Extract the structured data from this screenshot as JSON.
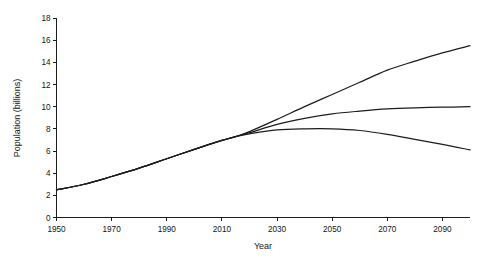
{
  "chart_data": {
    "type": "line",
    "title": "",
    "xlabel": "Year",
    "ylabel": "Population (billions)",
    "xlim": [
      1950,
      2100
    ],
    "ylim": [
      0,
      18
    ],
    "xticks": [
      1950,
      1970,
      1990,
      2010,
      2030,
      2050,
      2070,
      2090
    ],
    "yticks": [
      0,
      2,
      4,
      6,
      8,
      10,
      12,
      14,
      16,
      18
    ],
    "xtick_labels": [
      "1950",
      "1970",
      "1990",
      "2010",
      "2030",
      "2050",
      "2070",
      "2090"
    ],
    "ytick_labels": [
      "0",
      "2",
      "4",
      "6",
      "8",
      "10",
      "12",
      "14",
      "16",
      "18"
    ],
    "grid": false,
    "legend": "none",
    "line_color": "#1d1d1d",
    "background_color": "#ffffff",
    "x": [
      1950,
      1960,
      1970,
      1980,
      1990,
      2000,
      2010,
      2015,
      2020,
      2030,
      2040,
      2050,
      2060,
      2070,
      2080,
      2090,
      2100
    ],
    "series": [
      {
        "name": "high-variant",
        "values": [
          2.5,
          3.0,
          3.7,
          4.45,
          5.3,
          6.15,
          6.95,
          7.3,
          7.75,
          8.85,
          10.0,
          11.1,
          12.2,
          13.3,
          14.1,
          14.85,
          15.5
        ]
      },
      {
        "name": "medium-variant",
        "values": [
          2.5,
          3.0,
          3.7,
          4.45,
          5.3,
          6.15,
          6.95,
          7.3,
          7.65,
          8.4,
          8.95,
          9.35,
          9.6,
          9.8,
          9.9,
          9.95,
          10.0
        ]
      },
      {
        "name": "low-variant",
        "values": [
          2.5,
          3.0,
          3.7,
          4.45,
          5.3,
          6.15,
          6.95,
          7.3,
          7.55,
          7.9,
          8.0,
          8.0,
          7.85,
          7.5,
          7.05,
          6.6,
          6.1
        ]
      }
    ]
  },
  "figure": {
    "caption": ""
  }
}
